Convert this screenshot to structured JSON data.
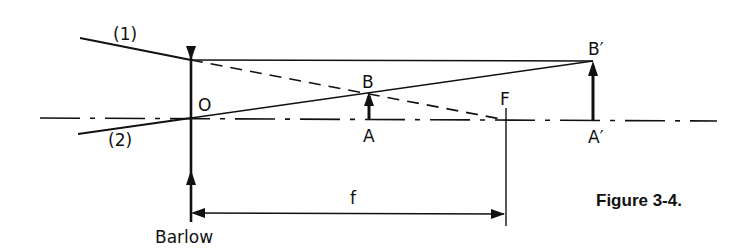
{
  "diagram": {
    "type": "optics-ray-diagram",
    "caption": "Figure 3-4.",
    "labels": {
      "ray1": "(1)",
      "ray2": "(2)",
      "lens_center": "O",
      "object_top": "B",
      "object_base": "A",
      "focal_point": "F",
      "image_top": "B′",
      "image_base": "A′",
      "focal_length": "f",
      "lens_name": "Barlow"
    },
    "colors": {
      "ink": "#111111",
      "background": "#ffffff"
    }
  }
}
